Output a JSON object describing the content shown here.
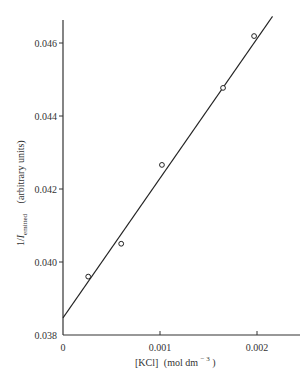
{
  "chart_data": {
    "type": "scatter",
    "title": "",
    "xlabel": "[KCl] (mol dm^-3)",
    "ylabel": "1/I_emitted (arbitrary units)",
    "xlim": [
      0,
      0.0024
    ],
    "ylim": [
      0.038,
      0.0467
    ],
    "x_ticks": [
      0,
      0.001,
      0.002
    ],
    "x_tick_labels": [
      "0",
      "0.001",
      "0.002"
    ],
    "y_ticks": [
      0.038,
      0.04,
      0.042,
      0.044,
      0.046
    ],
    "y_tick_labels": [
      "0.038",
      "0.040",
      "0.042",
      "0.044",
      "0.046"
    ],
    "grid": false,
    "legend": null,
    "series": [
      {
        "name": "measured",
        "marker": "open-circle",
        "x": [
          0.00026,
          0.0006,
          0.00102,
          0.00165,
          0.00197
        ],
        "y": [
          0.0396,
          0.0405,
          0.04266,
          0.04477,
          0.04619
        ]
      },
      {
        "name": "linear fit",
        "style": "line",
        "x": [
          0,
          0.00216
        ],
        "y": [
          0.03847,
          0.04673
        ]
      }
    ]
  },
  "axes": {
    "x_label_main": "[KCl]",
    "x_label_units": "(mol dm",
    "x_label_exp": "− 3",
    "x_label_close": ")",
    "y_label_main": "1/",
    "y_label_I": "I",
    "y_label_sub": "emitted",
    "y_label_units": "(arbitrary units)"
  }
}
